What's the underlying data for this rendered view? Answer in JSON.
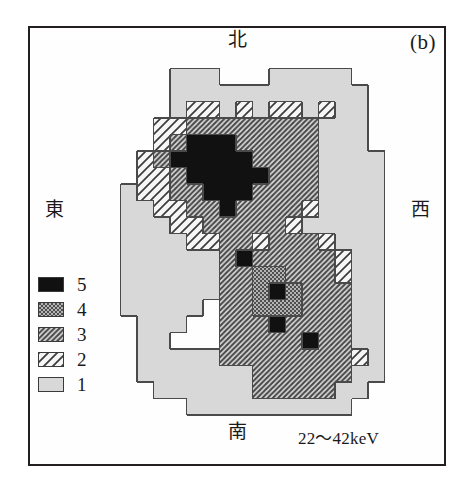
{
  "figure": {
    "panel_label": "(b)",
    "energy_band": "22～42keV",
    "directions": {
      "north": "北",
      "south": "南",
      "east": "東",
      "west": "西"
    }
  },
  "legend": {
    "title": "",
    "items": [
      {
        "level": "5",
        "pattern": "solid-black",
        "color": "#111111"
      },
      {
        "level": "4",
        "pattern": "checkerboard",
        "color": "#8a8a8a"
      },
      {
        "level": "3",
        "pattern": "dense-forward-hatch",
        "color": "#9a9a9a"
      },
      {
        "level": "2",
        "pattern": "sparse-backward-hatch",
        "color": "#f2f2f2"
      },
      {
        "level": "1",
        "pattern": "plain-light-gray",
        "color": "#d8d8d8"
      }
    ]
  },
  "chart_data": {
    "type": "heatmap",
    "title": "(b) 22～42keV",
    "xlabel": "",
    "ylabel": "",
    "grid": false,
    "legend_position": "left-bottom",
    "cell_size_px": 16.5,
    "origin_px": [
      104,
      52
    ],
    "orientation": {
      "top": "北",
      "bottom": "南",
      "left": "東",
      "right": "西"
    },
    "level_scale": [
      1,
      2,
      3,
      4,
      5
    ],
    "level_fills": {
      "1": "#d8d8d8",
      "2": "#f4f4f4",
      "3": "#9d9d9d",
      "4": "#8c8c8c",
      "5": "#111111"
    },
    "ncols": 19,
    "nrows": 23,
    "cells": [
      [
        0,
        0,
        0,
        0,
        0,
        0,
        0,
        0,
        0,
        0,
        0,
        0,
        0,
        0,
        0,
        0,
        0,
        0,
        0
      ],
      [
        0,
        0,
        0,
        0,
        1,
        1,
        1,
        0,
        0,
        0,
        1,
        1,
        1,
        1,
        1,
        0,
        0,
        0,
        0
      ],
      [
        0,
        0,
        0,
        0,
        1,
        1,
        1,
        1,
        1,
        1,
        1,
        1,
        1,
        1,
        1,
        1,
        0,
        0,
        0
      ],
      [
        0,
        0,
        0,
        0,
        1,
        2,
        2,
        1,
        2,
        1,
        2,
        2,
        1,
        2,
        1,
        1,
        0,
        0,
        0
      ],
      [
        0,
        0,
        0,
        2,
        2,
        3,
        3,
        3,
        3,
        3,
        3,
        3,
        3,
        1,
        1,
        1,
        0,
        0,
        0
      ],
      [
        0,
        0,
        0,
        2,
        3,
        5,
        5,
        5,
        3,
        3,
        3,
        3,
        3,
        1,
        1,
        1,
        0,
        0,
        0
      ],
      [
        0,
        0,
        2,
        3,
        5,
        5,
        5,
        5,
        5,
        3,
        3,
        3,
        3,
        1,
        1,
        1,
        1,
        0,
        0
      ],
      [
        0,
        0,
        2,
        2,
        3,
        5,
        5,
        5,
        5,
        5,
        3,
        3,
        3,
        1,
        1,
        1,
        1,
        0,
        0
      ],
      [
        0,
        1,
        2,
        2,
        3,
        3,
        5,
        5,
        5,
        3,
        3,
        3,
        3,
        1,
        1,
        1,
        1,
        0,
        0
      ],
      [
        0,
        1,
        1,
        2,
        2,
        3,
        3,
        5,
        3,
        3,
        3,
        3,
        2,
        1,
        1,
        1,
        1,
        0,
        0
      ],
      [
        0,
        1,
        1,
        1,
        2,
        2,
        3,
        3,
        3,
        3,
        3,
        2,
        1,
        1,
        1,
        1,
        1,
        0,
        0
      ],
      [
        0,
        1,
        1,
        1,
        1,
        2,
        2,
        3,
        3,
        2,
        3,
        3,
        3,
        2,
        1,
        1,
        1,
        0,
        0
      ],
      [
        0,
        1,
        1,
        1,
        1,
        1,
        1,
        3,
        5,
        3,
        3,
        3,
        3,
        3,
        2,
        1,
        1,
        0,
        0
      ],
      [
        0,
        1,
        1,
        1,
        1,
        1,
        1,
        3,
        3,
        4,
        4,
        3,
        3,
        3,
        2,
        1,
        1,
        0,
        0
      ],
      [
        0,
        1,
        1,
        1,
        1,
        1,
        1,
        3,
        3,
        4,
        5,
        4,
        3,
        3,
        3,
        1,
        1,
        0,
        0
      ],
      [
        0,
        1,
        1,
        1,
        1,
        1,
        0,
        3,
        3,
        4,
        4,
        4,
        3,
        3,
        3,
        1,
        1,
        0,
        0
      ],
      [
        0,
        0,
        1,
        1,
        1,
        0,
        0,
        3,
        3,
        3,
        5,
        3,
        3,
        3,
        3,
        1,
        1,
        0,
        0
      ],
      [
        0,
        0,
        1,
        1,
        0,
        0,
        0,
        3,
        3,
        3,
        3,
        3,
        5,
        3,
        3,
        1,
        1,
        0,
        0
      ],
      [
        0,
        0,
        1,
        1,
        1,
        1,
        1,
        3,
        3,
        3,
        3,
        3,
        3,
        3,
        3,
        2,
        1,
        0,
        0
      ],
      [
        0,
        0,
        1,
        1,
        1,
        1,
        1,
        1,
        1,
        3,
        3,
        3,
        3,
        3,
        3,
        1,
        1,
        0,
        0
      ],
      [
        0,
        0,
        0,
        1,
        1,
        1,
        1,
        1,
        1,
        3,
        3,
        3,
        3,
        3,
        1,
        1,
        0,
        0,
        0
      ],
      [
        0,
        0,
        0,
        0,
        0,
        1,
        1,
        1,
        1,
        1,
        1,
        1,
        1,
        1,
        1,
        0,
        0,
        0,
        0
      ],
      [
        0,
        0,
        0,
        0,
        0,
        0,
        0,
        0,
        0,
        0,
        0,
        0,
        0,
        0,
        0,
        0,
        0,
        0,
        0
      ]
    ]
  }
}
